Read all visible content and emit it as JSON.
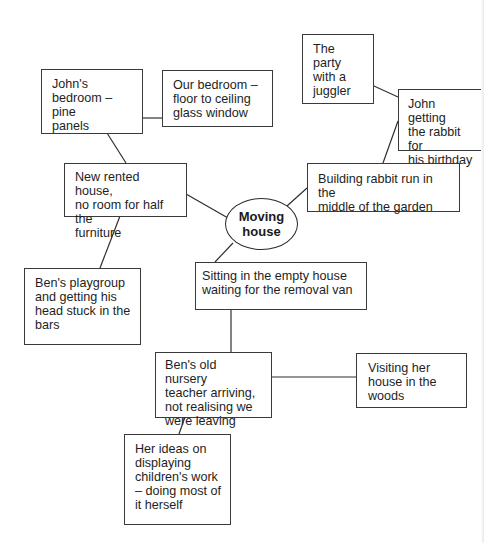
{
  "diagram": {
    "type": "mind-map",
    "center": {
      "id": "moving-house",
      "label": "Moving house"
    },
    "nodes": [
      {
        "id": "john-bedroom",
        "label": "John's bedroom – pine panels"
      },
      {
        "id": "our-bedroom",
        "label": "Our bedroom – floor to ceiling glass window"
      },
      {
        "id": "party-juggler",
        "label": "The party with a juggler"
      },
      {
        "id": "john-rabbit",
        "label": "John getting the rabbit for his birthday"
      },
      {
        "id": "new-rented-house",
        "label": "New rented house, no room for half the furniture"
      },
      {
        "id": "rabbit-run",
        "label": "Building rabbit run in the middle of the garden"
      },
      {
        "id": "empty-house",
        "label": "Sitting in the empty house waiting for the removal van"
      },
      {
        "id": "ben-playgroup",
        "label": "Ben's playgroup and getting his head stuck in the bars"
      },
      {
        "id": "nursery-teacher",
        "label": "Ben's old nursery teacher arriving, not realising we were leaving"
      },
      {
        "id": "visiting-house",
        "label": "Visiting her house in the woods"
      },
      {
        "id": "her-ideas",
        "label": "Her ideas on displaying children's work – doing most of it herself"
      }
    ],
    "edges": [
      [
        "moving-house",
        "new-rented-house"
      ],
      [
        "moving-house",
        "rabbit-run"
      ],
      [
        "moving-house",
        "empty-house"
      ],
      [
        "new-rented-house",
        "john-bedroom"
      ],
      [
        "john-bedroom",
        "our-bedroom"
      ],
      [
        "new-rented-house",
        "ben-playgroup"
      ],
      [
        "rabbit-run",
        "john-rabbit"
      ],
      [
        "john-rabbit",
        "party-juggler"
      ],
      [
        "empty-house",
        "nursery-teacher"
      ],
      [
        "nursery-teacher",
        "visiting-house"
      ],
      [
        "nursery-teacher",
        "her-ideas"
      ]
    ],
    "colors": {
      "line": "#2f2f2f",
      "border": "#3a3a3a",
      "text": "#1e1e1e",
      "background": "#ffffff"
    }
  },
  "text": {
    "center_line1": "Moving",
    "center_line2": "house",
    "john_bedroom": [
      "John's",
      "bedroom – pine",
      "panels"
    ],
    "our_bedroom": [
      "Our bedroom –",
      "floor to ceiling",
      "glass window"
    ],
    "party": [
      "The party",
      "with a",
      "juggler"
    ],
    "john_rabbit": [
      "John getting",
      "the rabbit for",
      "his birthday"
    ],
    "new_rented": [
      "New rented house,",
      "no room for half the",
      "furniture"
    ],
    "rabbit_run": [
      "Building rabbit run in the",
      "middle of the garden"
    ],
    "empty_house": [
      "Sitting in the empty house",
      "waiting for the removal van"
    ],
    "ben_playgroup": [
      "Ben's playgroup",
      "and getting his",
      "head stuck in the",
      "bars"
    ],
    "nursery_teacher": [
      "Ben's old nursery",
      "teacher arriving,",
      "not realising we",
      "were leaving"
    ],
    "visiting": [
      "Visiting her",
      "house in the",
      "woods"
    ],
    "her_ideas": [
      "Her ideas on",
      "displaying",
      "children's work",
      "– doing most of",
      "it herself"
    ]
  }
}
